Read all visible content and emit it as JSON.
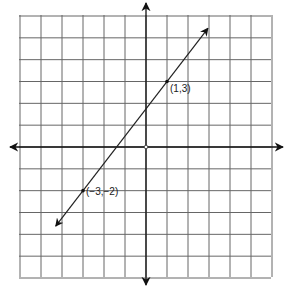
{
  "chart_data": {
    "type": "line",
    "title": "",
    "xlabel": "",
    "ylabel": "",
    "grid": true,
    "xlim": [
      -6,
      6
    ],
    "ylim": [
      -6,
      6
    ],
    "series": [
      {
        "name": "line through (-3,-2) and (1,3)",
        "x": [
          -3,
          1
        ],
        "y": [
          -2,
          3
        ],
        "slope": 1.25,
        "extends_with_arrows": true
      }
    ],
    "points": [
      {
        "x": 1,
        "y": 3,
        "label": "(1,3)"
      },
      {
        "x": -3,
        "y": -2,
        "label": "(−3,−2)"
      }
    ],
    "annotations": [
      "(1,3)",
      "(−3,−2)"
    ]
  },
  "labels": {
    "point_a": "(1,3)",
    "point_b": "(−3,−2)"
  },
  "colors": {
    "grid": "#555555",
    "axis": "#111111",
    "line": "#222222",
    "background": "#ffffff"
  }
}
